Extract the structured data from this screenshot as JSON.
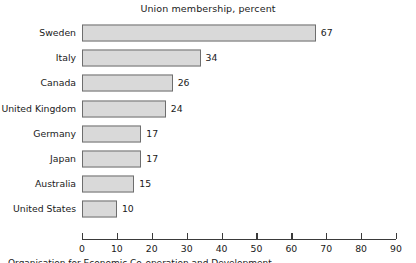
{
  "chart_data": {
    "type": "bar",
    "orientation": "horizontal",
    "title": "Union membership, percent",
    "xlabel": "",
    "ylabel": "",
    "categories": [
      "Sweden",
      "Italy",
      "Canada",
      "United Kingdom",
      "Germany",
      "Japan",
      "Australia",
      "United States"
    ],
    "values": [
      67,
      34,
      26,
      24,
      17,
      17,
      15,
      10
    ],
    "value_labels": [
      "67",
      "34",
      "26",
      "24",
      "17",
      "17",
      "15",
      "10"
    ],
    "xlim": [
      0,
      90
    ],
    "xticks": [
      0,
      10,
      20,
      30,
      40,
      50,
      60,
      70,
      80,
      90
    ],
    "xtick_labels": [
      "0",
      "10",
      "20",
      "30",
      "40",
      "50",
      "60",
      "70",
      "80",
      "90"
    ],
    "grid": false,
    "legend": null,
    "bar_fill_color": "#d9d9d9",
    "bar_border_color": "#6e6e6e",
    "axis_color": "#3a3a3a",
    "background_color": "#ffffff",
    "text_color": "#1a1a1a"
  },
  "footnote": {
    "text": "Organisation for Economic Co-operation and Development"
  }
}
